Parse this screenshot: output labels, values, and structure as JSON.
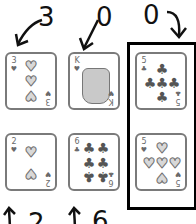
{
  "labels": {
    "top": [
      {
        "id": "col1",
        "text": "3"
      },
      {
        "id": "col2",
        "text": "0"
      },
      {
        "id": "col3",
        "text": "0"
      }
    ],
    "bottom": [
      {
        "id": "col1",
        "text": "2"
      },
      {
        "id": "col2",
        "text": "6"
      }
    ]
  },
  "cards": [
    {
      "rank": "3",
      "suit": "hearts",
      "suit_glyph": "♥",
      "row": 1,
      "col": 1
    },
    {
      "rank": "K",
      "suit": "hearts",
      "suit_glyph": "♥",
      "row": 1,
      "col": 2,
      "illustration": "cat-king"
    },
    {
      "rank": "5",
      "suit": "clubs",
      "suit_glyph": "♣",
      "row": 1,
      "col": 3
    },
    {
      "rank": "2",
      "suit": "hearts",
      "suit_glyph": "♥",
      "row": 2,
      "col": 1
    },
    {
      "rank": "6",
      "suit": "clubs",
      "suit_glyph": "♣",
      "row": 2,
      "col": 2
    },
    {
      "rank": "5",
      "suit": "hearts",
      "suit_glyph": "♥",
      "row": 2,
      "col": 3
    }
  ],
  "highlight_box": {
    "column": 3,
    "color": "#000000"
  },
  "colors": {
    "card_border": "#7a7a7a",
    "heart_fill": "#d8d8d8",
    "club_fill": "#555555",
    "ink": "#111111"
  }
}
